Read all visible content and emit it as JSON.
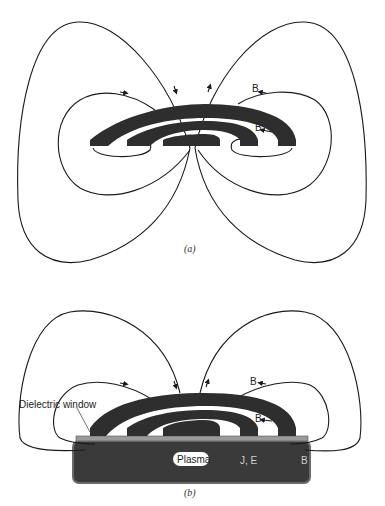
{
  "figure": {
    "panel_a": {
      "caption": "(a)",
      "labels": {
        "b_outer": "B",
        "b_inner": "B"
      }
    },
    "panel_b": {
      "caption": "(b)",
      "labels": {
        "dielectric_window": "Dielectric window",
        "plasma": "Plasma",
        "b_outer": "B",
        "b_inner": "B",
        "current_density": "J, E",
        "b_plasma": "B"
      }
    }
  },
  "colors": {
    "coil": "#2e2e2e",
    "plasma": "#3a3a3a",
    "plasma_edge": "#6a6a6a",
    "window": "#9a9a9a",
    "field_line": "#1a1a1a"
  }
}
